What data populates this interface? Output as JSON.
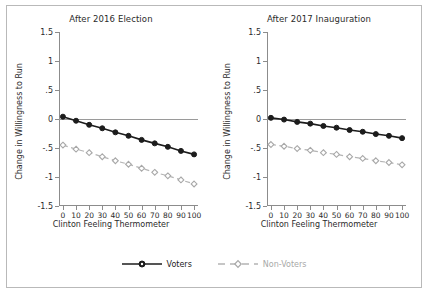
{
  "figure": {
    "xlabel": "Clinton Feeling Thermometer",
    "ylabel": "Change in Willingness to Run"
  },
  "legend": {
    "items": [
      {
        "label": "Voters",
        "key": "solid-line-circle-marker",
        "color": "#1c1c1c"
      },
      {
        "label": "Non-Voters",
        "key": "dashed-line-diamond-marker",
        "color": "#a8a8a8"
      }
    ]
  },
  "axes": {
    "y_ticks": [
      "1.5",
      "1",
      ".5",
      "0",
      "-.5",
      "-1",
      "-1.5"
    ],
    "y_tick_values": [
      1.5,
      1,
      0.5,
      0,
      -0.5,
      -1,
      -1.5
    ],
    "x_ticks": [
      "0",
      "10",
      "20",
      "30",
      "40",
      "50",
      "60",
      "70",
      "80",
      "90",
      "100"
    ],
    "x_tick_values": [
      0,
      10,
      20,
      30,
      40,
      50,
      60,
      70,
      80,
      90,
      100
    ]
  },
  "chart_data": [
    {
      "type": "line",
      "title": "After 2016 Election",
      "xlabel": "Clinton Feeling Thermometer",
      "ylabel": "Change in Willingness to Run",
      "x": [
        0,
        10,
        20,
        30,
        40,
        50,
        60,
        70,
        80,
        90,
        100
      ],
      "xlim": [
        -3,
        103
      ],
      "ylim": [
        -1.5,
        1.5
      ],
      "grid": false,
      "legend_position": "bottom-outside",
      "series": [
        {
          "name": "Voters",
          "color": "#1c1c1c",
          "style": "solid",
          "marker": "circle",
          "values": [
            0.04,
            -0.03,
            -0.1,
            -0.16,
            -0.23,
            -0.29,
            -0.36,
            -0.42,
            -0.48,
            -0.55,
            -0.61
          ]
        },
        {
          "name": "Non-Voters",
          "color": "#a8a8a8",
          "style": "dashed",
          "marker": "diamond",
          "values": [
            -0.45,
            -0.52,
            -0.58,
            -0.65,
            -0.72,
            -0.78,
            -0.85,
            -0.92,
            -0.98,
            -1.05,
            -1.12
          ]
        }
      ]
    },
    {
      "type": "line",
      "title": "After 2017 Inauguration",
      "xlabel": "Clinton Feeling Thermometer",
      "ylabel": "Change in Willingness to Run",
      "x": [
        0,
        10,
        20,
        30,
        40,
        50,
        60,
        70,
        80,
        90,
        100
      ],
      "xlim": [
        -3,
        103
      ],
      "ylim": [
        -1.5,
        1.5
      ],
      "grid": false,
      "legend_position": "bottom-outside",
      "series": [
        {
          "name": "Voters",
          "color": "#1c1c1c",
          "style": "solid",
          "marker": "circle",
          "values": [
            0.02,
            -0.01,
            -0.05,
            -0.08,
            -0.12,
            -0.15,
            -0.19,
            -0.22,
            -0.26,
            -0.29,
            -0.33
          ]
        },
        {
          "name": "Non-Voters",
          "color": "#a8a8a8",
          "style": "dashed",
          "marker": "diamond",
          "values": [
            -0.44,
            -0.47,
            -0.51,
            -0.54,
            -0.58,
            -0.61,
            -0.65,
            -0.68,
            -0.72,
            -0.75,
            -0.79
          ]
        }
      ]
    }
  ]
}
